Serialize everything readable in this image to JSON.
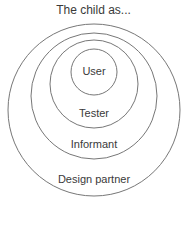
{
  "title": "The child as...",
  "circles": [
    {
      "label": "User"
    },
    {
      "label": "Tester"
    },
    {
      "label": "Informant"
    },
    {
      "label": "Design partner"
    }
  ],
  "colors": {
    "stroke": "#777777",
    "text": "#3a3a3a"
  }
}
